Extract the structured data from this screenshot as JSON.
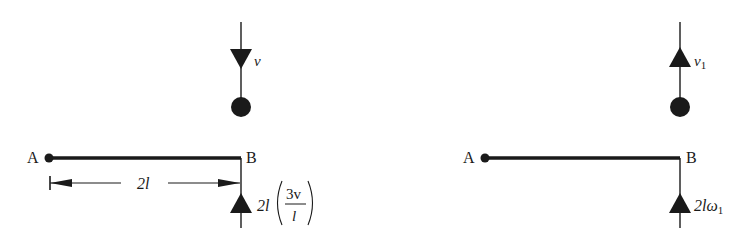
{
  "diagram": {
    "before": {
      "particle_velocity_label": "v",
      "particle_velocity_direction": "down",
      "point_a_label": "A",
      "point_b_label": "B",
      "dimension_label": "2l",
      "end_b_velocity_label": {
        "prefix": "2l",
        "fraction_numerator": "3v",
        "fraction_denominator": "l"
      },
      "end_b_velocity_direction": "up"
    },
    "after": {
      "particle_velocity_label": "v",
      "particle_velocity_subscript": "1",
      "particle_velocity_direction": "up",
      "point_a_label": "A",
      "point_b_label": "B",
      "end_b_velocity_label": "2lω",
      "end_b_velocity_subscript": "1",
      "end_b_velocity_direction": "up"
    },
    "colors": {
      "ink": "#1a1a1a",
      "background": "#ffffff"
    }
  }
}
